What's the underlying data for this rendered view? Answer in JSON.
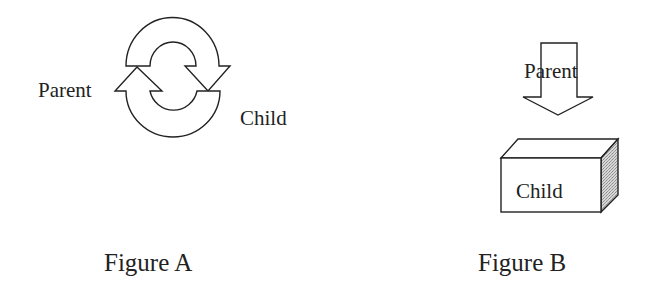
{
  "figure_a": {
    "caption": "Figure A",
    "labels": {
      "parent": "Parent",
      "child": "Child"
    },
    "shape": "circular-arrows-cycle"
  },
  "figure_b": {
    "caption": "Figure B",
    "labels": {
      "parent": "Parent",
      "child": "Child"
    },
    "shape": "down-arrow-into-box"
  },
  "colors": {
    "stroke": "#222222",
    "fill": "#ffffff",
    "shade": "#c8c8c8",
    "text": "#222222"
  }
}
